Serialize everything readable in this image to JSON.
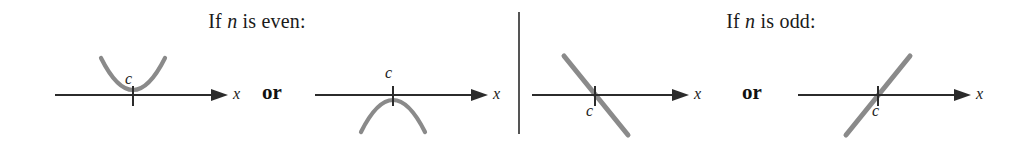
{
  "figure": {
    "panels": [
      {
        "id": "even",
        "heading_prefix": "If ",
        "heading_var": "n",
        "heading_suffix": " is even:",
        "heading_full": "If n is even:",
        "connector": "or",
        "diagrams": [
          {
            "id": "even-up",
            "shape": "parabola-opening-up-tangent-to-axis",
            "point_label": "c",
            "point_label_position": "above-axis",
            "axis_label": "x",
            "behavior": "does not cross the x-axis; touches at c from above"
          },
          {
            "id": "even-down",
            "shape": "parabola-opening-down-tangent-to-axis",
            "point_label": "c",
            "point_label_position": "above-axis",
            "axis_label": "x",
            "behavior": "does not cross the x-axis; touches at c from below"
          }
        ]
      },
      {
        "id": "odd",
        "heading_prefix": "If ",
        "heading_var": "n",
        "heading_suffix": " is odd:",
        "heading_full": "If n is odd:",
        "connector": "or",
        "diagrams": [
          {
            "id": "odd-down",
            "shape": "line-negative-slope-crossing-axis",
            "point_label": "c",
            "point_label_position": "below-axis",
            "axis_label": "x",
            "behavior": "crosses the x-axis at c going downward"
          },
          {
            "id": "odd-up",
            "shape": "line-positive-slope-crossing-axis",
            "point_label": "c",
            "point_label_position": "below-axis",
            "axis_label": "x",
            "behavior": "crosses the x-axis at c going upward"
          }
        ]
      }
    ],
    "colors": {
      "background": "#ffffff",
      "axis": "#2b2b2b",
      "curve": "#8a8a8a",
      "text": "#1a1a1a",
      "divider": "#555555"
    }
  }
}
